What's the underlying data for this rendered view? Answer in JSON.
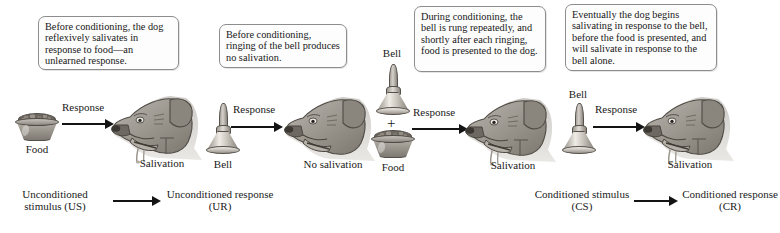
{
  "figure": {
    "background_color": "#ffffff",
    "ink_color": "#1a1a1a",
    "box_border_color": "#8d8d8d"
  },
  "callouts": [
    {
      "id": "callout-1",
      "text": "Before conditioning, the dog reflexively salivates in response to food—an unlearned response."
    },
    {
      "id": "callout-2",
      "text": "Before conditioning, ringing of the bell produces no salivation."
    },
    {
      "id": "callout-3",
      "text": "During conditioning, the bell is rung repeatedly, and shortly after each ringing, food is presented to the dog."
    },
    {
      "id": "callout-4",
      "text": "Eventually the dog begins salivating in response to the bell, before the food is presented, and will salivate in response to the bell alone."
    }
  ],
  "panels": [
    {
      "id": "panel-1",
      "stimulus_label": "Food",
      "arrow_label": "Response",
      "outcome_label": "Salivation",
      "stimulus_icon": "dog-food-bowl-icon",
      "outcome_icon": "dog-head-salivating-icon"
    },
    {
      "id": "panel-2",
      "stimulus_label": "Bell",
      "arrow_label": "Response",
      "outcome_label": "No salivation",
      "stimulus_icon": "hand-bell-icon",
      "outcome_icon": "dog-head-icon"
    },
    {
      "id": "panel-3",
      "stimulus_label_top": "Bell",
      "plus_sign": "+",
      "stimulus_label_bottom": "Food",
      "arrow_label": "Response",
      "outcome_label": "Salivation",
      "stimulus_icon_top": "hand-bell-icon",
      "stimulus_icon_bottom": "dog-food-bowl-icon",
      "outcome_icon": "dog-head-salivating-icon"
    },
    {
      "id": "panel-4",
      "stimulus_label": "Bell",
      "arrow_label": "Response",
      "outcome_label": "Salivation",
      "stimulus_icon": "hand-bell-icon",
      "outcome_icon": "dog-head-salivating-icon"
    }
  ],
  "summaries": [
    {
      "id": "summary-unconditioned",
      "stimulus": "Unconditioned stimulus (US)",
      "response": "Unconditioned response (UR)"
    },
    {
      "id": "summary-conditioned",
      "stimulus": "Conditioned stimulus (CS)",
      "response": "Conditioned response (CR)"
    }
  ]
}
